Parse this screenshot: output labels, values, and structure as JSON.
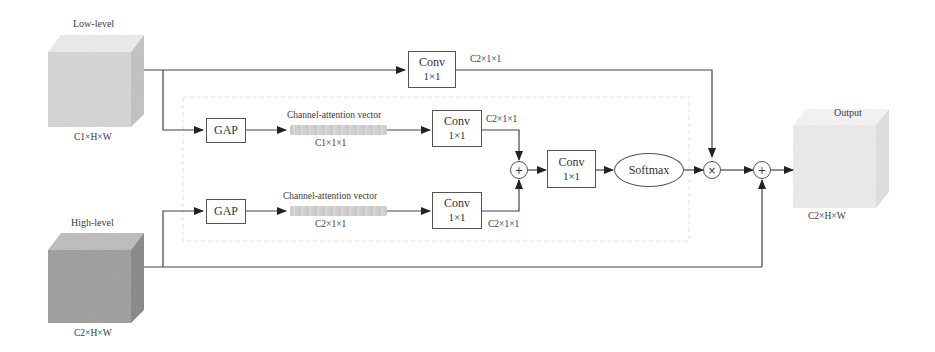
{
  "diagram": {
    "inputs": {
      "low_level": {
        "title": "Low-level",
        "shape": "C1×H×W",
        "color": "#d9d9d9"
      },
      "high_level": {
        "title": "High-level",
        "shape": "C2×H×W",
        "color": "#9a9a9a"
      }
    },
    "output": {
      "title": "Output",
      "shape": "C2×H×W",
      "color": "#eeeeee"
    },
    "top_branch": {
      "conv": {
        "line1": "Conv",
        "line2": "1×1"
      },
      "out_shape": "C2×1×1"
    },
    "low_branch": {
      "gap": "GAP",
      "vector_label": "Channel-attention vector",
      "vector_shape": "C1×1×1",
      "conv": {
        "line1": "Conv",
        "line2": "1×1"
      },
      "out_shape": "C2×1×1"
    },
    "high_branch": {
      "gap": "GAP",
      "vector_label": "Channel-attention vector",
      "vector_shape": "C2×1×1",
      "conv": {
        "line1": "Conv",
        "line2": "1×1"
      },
      "out_shape": "C2×1×1"
    },
    "fusion": {
      "add_symbol": "+",
      "conv": {
        "line1": "Conv",
        "line2": "1×1"
      },
      "softmax": "Softmax",
      "multiply_symbol": "×",
      "residual_add_symbol": "+"
    }
  }
}
